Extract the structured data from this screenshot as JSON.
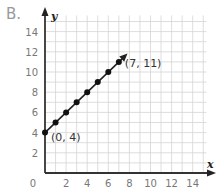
{
  "problem_label": "B.",
  "chart_data": {
    "type": "line",
    "title": "",
    "xlabel": "x",
    "ylabel": "y",
    "xlim": [
      0,
      15
    ],
    "ylim": [
      0,
      15.5
    ],
    "grid": true,
    "x_ticks": [
      "2",
      "4",
      "6",
      "8",
      "10",
      "12",
      "14"
    ],
    "y_ticks": [
      "2",
      "4",
      "6",
      "8",
      "10",
      "12",
      "14"
    ],
    "origin_label": "0",
    "series": [
      {
        "name": "line",
        "x": [
          0,
          1,
          2,
          3,
          4,
          5,
          6,
          7
        ],
        "y": [
          4,
          5,
          6,
          7,
          8,
          9,
          10,
          11
        ],
        "markers": true,
        "arrow_end": true
      }
    ],
    "annotations": [
      {
        "text": "(0, 4)",
        "x": 0,
        "y": 4
      },
      {
        "text": "(7, 11)",
        "x": 7,
        "y": 11
      }
    ]
  }
}
